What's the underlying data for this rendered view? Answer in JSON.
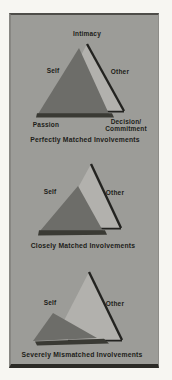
{
  "colors": {
    "page_background": "#f7f6f2",
    "panel_background": "#9c9c98",
    "self_triangle_fill": "#6d6d69",
    "other_triangle_fill": "#b2b1ad",
    "dark_edge": "#232320",
    "shadow": "#3a3a34",
    "label_text": "#1d1d19"
  },
  "diagrams": [
    {
      "apex_label": "Intimacy",
      "left_label": "Self",
      "right_label": "Other",
      "bottom_left_label": "Passion",
      "bottom_right_label_line1": "Decision/",
      "bottom_right_label_line2": "Commitment",
      "caption": "Perfectly Matched Involvements"
    },
    {
      "left_label": "Self",
      "right_label": "Other",
      "caption": "Closely Matched Involvements"
    },
    {
      "left_label": "Self",
      "right_label": "Other",
      "caption": "Severely Mismatched Involvements"
    }
  ]
}
